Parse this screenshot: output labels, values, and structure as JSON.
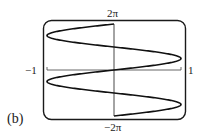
{
  "figure": {
    "panel_label": "(b)",
    "labels": {
      "y_max": "2π",
      "y_min": "−2π",
      "x_min": "−1",
      "x_max": "1"
    },
    "colors": {
      "frame": "#1a1a1a",
      "curve": "#111111",
      "axis": "#555555"
    }
  },
  "chart_data": {
    "type": "line",
    "title": "",
    "xlabel": "",
    "ylabel": "",
    "xlim": [
      -1,
      1
    ],
    "ylim": [
      -6.2832,
      6.2832
    ],
    "tick_labels": {
      "x": [
        "−1",
        "1"
      ],
      "y": [
        "−2π",
        "2π"
      ]
    },
    "grid": false,
    "series": [
      {
        "name": "x = sin(t), y = t",
        "x_expr": "sin(t)",
        "y_expr": "t",
        "t_range": [
          -6.2832,
          6.2832
        ]
      }
    ]
  }
}
